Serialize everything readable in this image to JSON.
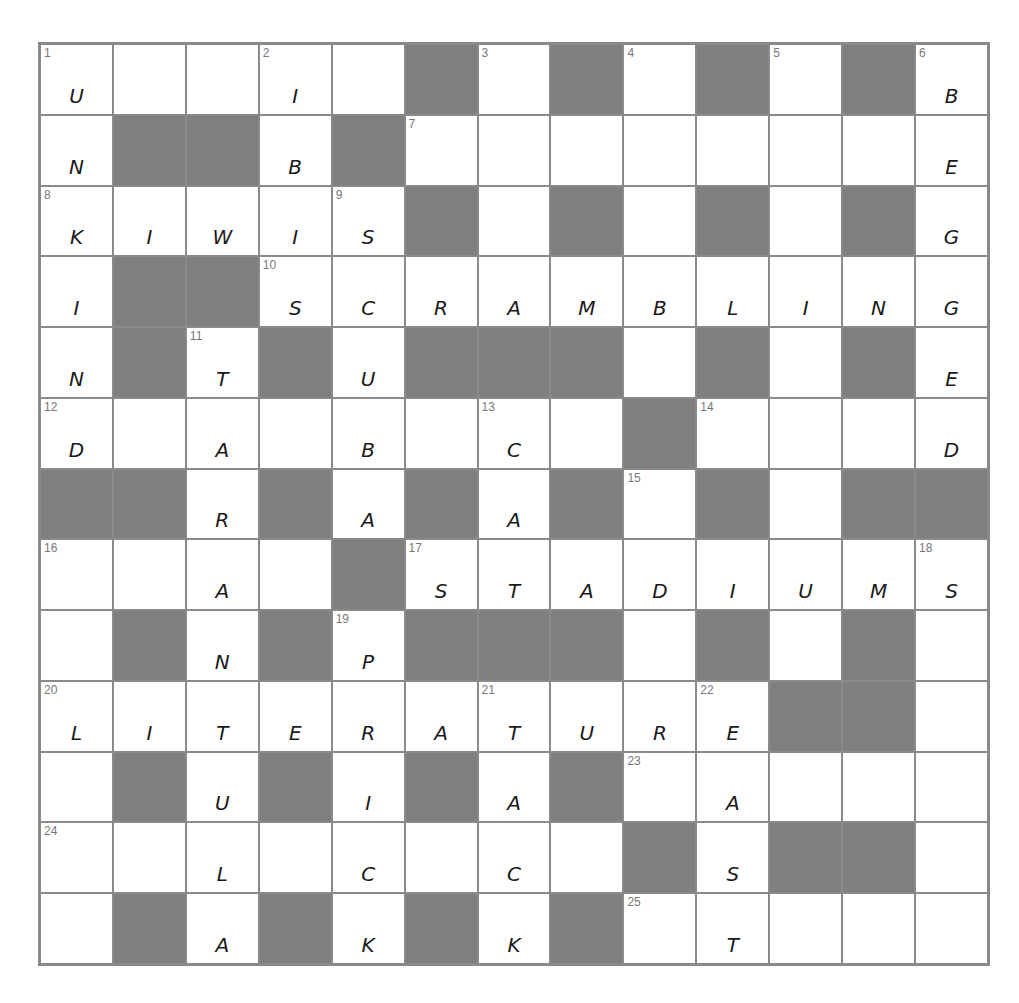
{
  "puzzle": {
    "size": 13,
    "colors": {
      "black_cell": "#7f7f7f",
      "grid_line": "#8a8a8a",
      "white_cell": "#ffffff",
      "ink": "#1a1a1a"
    },
    "rows": [
      "U..I.#.#.#.#B",
      "N##B#.......E",
      "KIWIS#.#.#.#G",
      "I##SCRAMBLING",
      "N#T#U###.#.#E",
      "D.A.B.C.#...D",
      "##R#A#A#.#.##",
      "..A.#STADIUMS",
      ".#N#P###.#.#.",
      "LITERATURE##.",
      ".#U#I#A#.A...",
      "..L.C.C.#S##.",
      ".#A#K#K#.T..."
    ],
    "numbers": [
      {
        "r": 0,
        "c": 0,
        "n": "1"
      },
      {
        "r": 0,
        "c": 3,
        "n": "2"
      },
      {
        "r": 0,
        "c": 6,
        "n": "3"
      },
      {
        "r": 0,
        "c": 8,
        "n": "4"
      },
      {
        "r": 0,
        "c": 10,
        "n": "5"
      },
      {
        "r": 0,
        "c": 12,
        "n": "6"
      },
      {
        "r": 1,
        "c": 5,
        "n": "7"
      },
      {
        "r": 2,
        "c": 0,
        "n": "8"
      },
      {
        "r": 2,
        "c": 4,
        "n": "9"
      },
      {
        "r": 3,
        "c": 3,
        "n": "10"
      },
      {
        "r": 4,
        "c": 2,
        "n": "11"
      },
      {
        "r": 5,
        "c": 0,
        "n": "12"
      },
      {
        "r": 5,
        "c": 6,
        "n": "13"
      },
      {
        "r": 5,
        "c": 9,
        "n": "14"
      },
      {
        "r": 6,
        "c": 8,
        "n": "15"
      },
      {
        "r": 7,
        "c": 0,
        "n": "16"
      },
      {
        "r": 7,
        "c": 5,
        "n": "17"
      },
      {
        "r": 7,
        "c": 12,
        "n": "18"
      },
      {
        "r": 8,
        "c": 4,
        "n": "19"
      },
      {
        "r": 9,
        "c": 0,
        "n": "20"
      },
      {
        "r": 9,
        "c": 6,
        "n": "21"
      },
      {
        "r": 9,
        "c": 9,
        "n": "22"
      },
      {
        "r": 10,
        "c": 8,
        "n": "23"
      },
      {
        "r": 11,
        "c": 0,
        "n": "24"
      },
      {
        "r": 12,
        "c": 8,
        "n": "25"
      }
    ],
    "filled_answers": {
      "1_down": "UNKIND",
      "2_down": "IBIS",
      "6_down": "BEGGED",
      "8_across": "KIWIS",
      "9_down": "SCUBA",
      "10_across": "SCRAMBLING",
      "11_down": "TARANTULA",
      "13_down": "CAT",
      "17_across": "STADIUMS",
      "19_down": "PRICK",
      "20_across": "LITERATURE",
      "21_down": "TACK",
      "22_down": "EAST"
    }
  }
}
